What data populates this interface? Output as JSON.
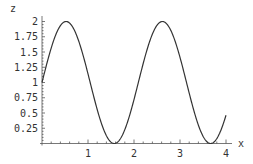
{
  "chart_data": {
    "type": "line",
    "title": "",
    "xlabel": "x",
    "ylabel": "z",
    "xlim": [
      0,
      4
    ],
    "ylim": [
      0,
      2
    ],
    "xticks": [
      "1",
      "2",
      "3",
      "4"
    ],
    "yticks": [
      "0.25",
      "0.5",
      "0.75",
      "1",
      "1.25",
      "1.5",
      "1.75",
      "2"
    ],
    "grid": false,
    "legend": null,
    "series": [
      {
        "name": "z = 1 + sin(3x)",
        "x": [
          0,
          0.25,
          0.52,
          0.75,
          1.0,
          1.25,
          1.57,
          1.75,
          2.0,
          2.25,
          2.62,
          2.75,
          3.0,
          3.25,
          3.67,
          3.75,
          4.0
        ],
        "values": [
          1.0,
          1.68,
          2.0,
          1.78,
          1.14,
          0.43,
          0.0,
          0.14,
          0.72,
          1.45,
          2.0,
          1.92,
          1.41,
          0.66,
          0.0,
          0.02,
          0.46
        ]
      }
    ],
    "line_color": "#333333"
  }
}
